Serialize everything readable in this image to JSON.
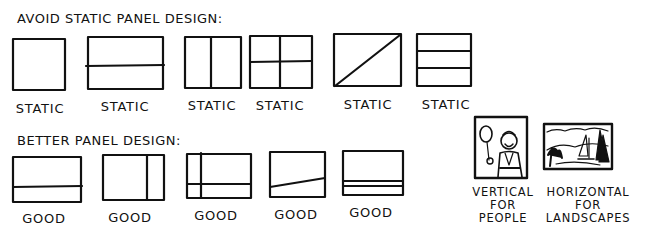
{
  "sections": {
    "avoid": {
      "heading": "AVOID STATIC PANEL DESIGN:",
      "panels": [
        {
          "label": "STATIC",
          "type": "square"
        },
        {
          "label": "STATIC",
          "type": "horizontal-split-middle"
        },
        {
          "label": "STATIC",
          "type": "vertical-split-middle"
        },
        {
          "label": "STATIC",
          "type": "quad-split"
        },
        {
          "label": "STATIC",
          "type": "diagonal-split"
        },
        {
          "label": "STATIC",
          "type": "three-rows"
        }
      ]
    },
    "better": {
      "heading": "BETTER PANEL DESIGN:",
      "panels": [
        {
          "label": "GOOD",
          "type": "horizontal-split-low"
        },
        {
          "label": "GOOD",
          "type": "vertical-split-right"
        },
        {
          "label": "GOOD",
          "type": "offset-cross"
        },
        {
          "label": "GOOD",
          "type": "slanted-split"
        },
        {
          "label": "GOOD",
          "type": "double-line-low"
        }
      ]
    }
  },
  "examples": {
    "vertical": {
      "line1": "VERTICAL",
      "line2": "FOR",
      "line3": "PEOPLE"
    },
    "horizontal": {
      "line1": "HORIZONTAL",
      "line2": "FOR",
      "line3": "LANDSCAPES"
    }
  }
}
